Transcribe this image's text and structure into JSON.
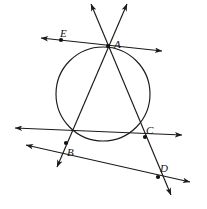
{
  "figure": {
    "type": "geometry-diagram",
    "width": 207,
    "height": 209,
    "background_color": "#ffffff",
    "stroke_color": "#1a1a1a",
    "labels": {
      "a": "A",
      "b": "B",
      "c": "C",
      "d": "D",
      "e": "E"
    },
    "points": [
      {
        "name": "A",
        "label": "A",
        "x": 108,
        "y": 46,
        "label_x": 114,
        "label_y": 39
      },
      {
        "name": "B",
        "label": "B",
        "x": 66,
        "y": 143,
        "label_x": 67,
        "label_y": 147
      },
      {
        "name": "C",
        "label": "C",
        "x": 145,
        "y": 137,
        "label_x": 146,
        "label_y": 125
      },
      {
        "name": "D",
        "label": "D",
        "x": 158,
        "y": 177,
        "label_x": 160,
        "label_y": 163
      },
      {
        "name": "E",
        "label": "E",
        "x": 61,
        "y": 40,
        "label_x": 60,
        "label_y": 28
      }
    ],
    "circle": {
      "cx": 103,
      "cy": 94,
      "r": 47
    },
    "lines": [
      {
        "name": "tangent-through-A-and-E",
        "x1": 41,
        "y1": 38,
        "x2": 162,
        "y2": 51,
        "arrows": "both"
      },
      {
        "name": "secant-A-to-B",
        "x1": 127,
        "y1": 4,
        "x2": 57,
        "y2": 167,
        "arrows": "both"
      },
      {
        "name": "secant-A-through-C-to-D",
        "x1": 91,
        "y1": 4,
        "x2": 171,
        "y2": 195,
        "arrows": "both"
      },
      {
        "name": "line-B-to-C",
        "x1": 15,
        "y1": 128,
        "x2": 182,
        "y2": 135,
        "arrows": "both"
      },
      {
        "name": "line-B-to-D",
        "x1": 26,
        "y1": 145,
        "x2": 190,
        "y2": 182,
        "arrows": "both"
      }
    ]
  }
}
